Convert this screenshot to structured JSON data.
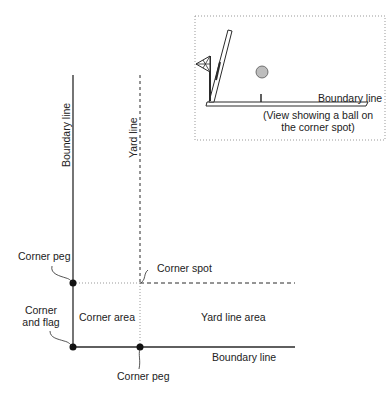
{
  "diagram": {
    "type": "corner-area-layout",
    "colors": {
      "line": "#2a2a2a",
      "dotted": "#888888",
      "ball": "#bdbdbd"
    },
    "inset": {
      "boundary_label": "Boundary line",
      "caption_line1": "(View showing a ball on",
      "caption_line2": "the corner spot)"
    },
    "labels": {
      "left_boundary": "Boundary line",
      "yard_line": "Yard line",
      "corner_peg_top": "Corner peg",
      "corner_spot": "Corner spot",
      "corner_and_flag_line1": "Corner",
      "corner_and_flag_line2": "and flag",
      "corner_area": "Corner area",
      "yard_line_area": "Yard line area",
      "bottom_boundary": "Boundary line",
      "corner_peg_bottom": "Corner peg"
    }
  }
}
